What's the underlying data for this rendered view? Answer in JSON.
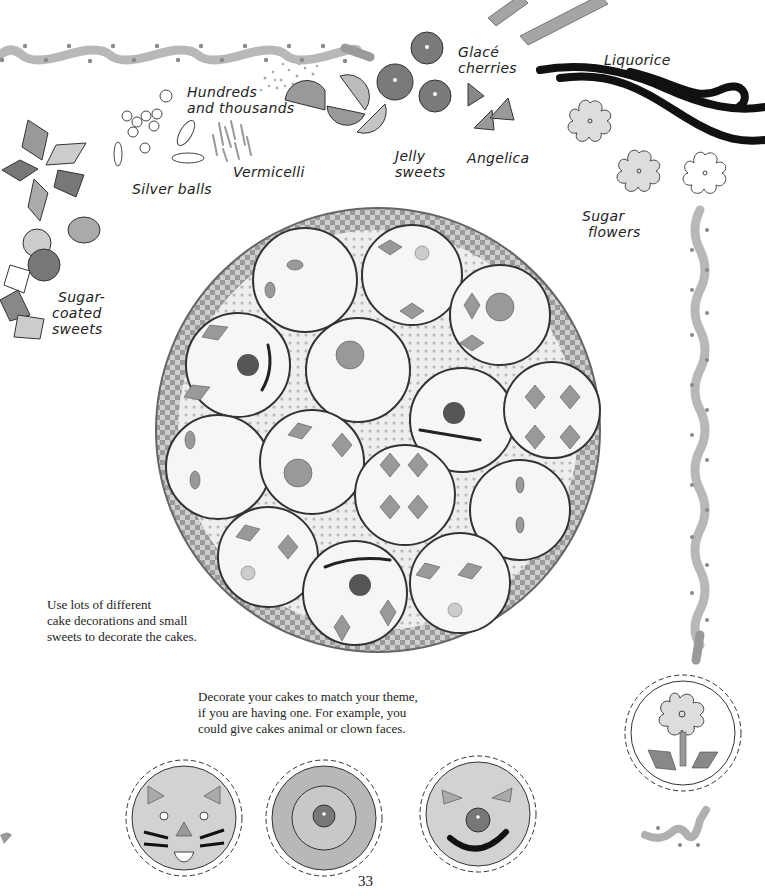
{
  "page": {
    "page_number": "33",
    "background": "#ffffff"
  },
  "labels": {
    "hundreds_and_thousands": [
      "Hundreds",
      "and thousands"
    ],
    "silver_balls": "Silver balls",
    "vermicelli": "Vermicelli",
    "jelly_sweets": [
      "Jelly",
      "sweets"
    ],
    "glace_cherries": [
      "Glacé",
      "cherries"
    ],
    "angelica": "Angelica",
    "liquorice": "Liquorice",
    "sugar_flowers": [
      "Sugar",
      "flowers"
    ],
    "sugar_coated_sweets": [
      "Sugar-",
      "coated",
      "sweets"
    ]
  },
  "captions": {
    "left": [
      "Use lots of different",
      "cake decorations and small",
      "sweets to decorate the cakes."
    ],
    "bottom": [
      "Decorate your cakes to match your theme,",
      "if you are having one. For example, you",
      "could give cakes animal or clown faces."
    ]
  },
  "illustrations": {
    "photo": "basket-of-decorated-cakes",
    "example_cakes": [
      "cat-face-cake",
      "target-cake",
      "clown-face-cake",
      "flower-cake"
    ]
  },
  "colors": {
    "wave_border": "#b5b5b5",
    "wave_dots": "#8a8a8a",
    "dark_sweet": "#7a7a7a",
    "mid_sweet": "#a8a8a8",
    "light_sweet": "#d2d2d2",
    "liquorice": "#111111"
  }
}
